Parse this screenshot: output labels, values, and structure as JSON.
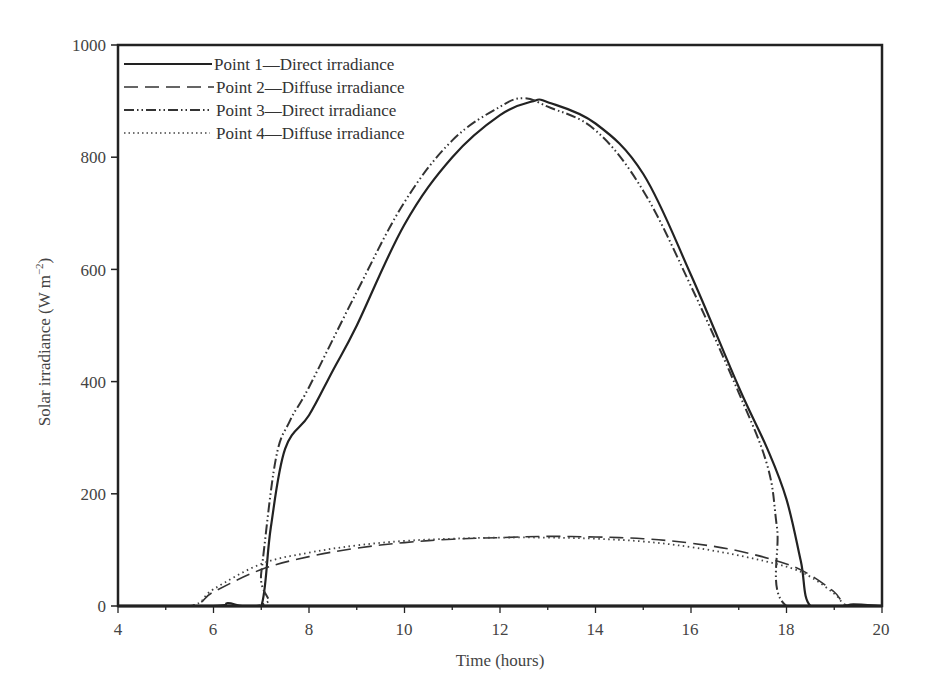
{
  "chart_data": {
    "type": "line",
    "title": "",
    "xlabel": "Time (hours)",
    "ylabel": "Solar irradiance (W m⁻²)",
    "xlim": [
      4,
      20
    ],
    "ylim": [
      0,
      1000
    ],
    "xticks": [
      4,
      6,
      8,
      10,
      12,
      14,
      16,
      18,
      20
    ],
    "yticks": [
      0,
      200,
      400,
      600,
      800,
      1000
    ],
    "grid": false,
    "legend_position": "upper-left",
    "series": [
      {
        "name": "Point 1—Direct irradiance",
        "style": "solid",
        "x": [
          4,
          6.0,
          6.3,
          6.6,
          7.0,
          7.2,
          7.5,
          8.0,
          8.5,
          9.0,
          10.0,
          11.0,
          12.0,
          12.7,
          13.0,
          14.0,
          15.0,
          16.0,
          17.0,
          17.6,
          18.0,
          18.3,
          18.5,
          19.2,
          19.4,
          20
        ],
        "y": [
          0,
          0,
          5,
          0,
          0,
          140,
          280,
          340,
          420,
          500,
          680,
          800,
          875,
          900,
          898,
          860,
          770,
          590,
          390,
          280,
          190,
          80,
          0,
          0,
          3,
          0
        ]
      },
      {
        "name": "Point 2—Diffuse irradiance",
        "style": "dashed",
        "x": [
          4,
          5.5,
          6.0,
          7.0,
          8.0,
          9.0,
          10.0,
          11.0,
          12.0,
          13.0,
          14.0,
          15.0,
          16.0,
          17.0,
          18.0,
          18.5,
          19.0,
          19.3,
          20
        ],
        "y": [
          0,
          0,
          25,
          65,
          88,
          103,
          113,
          119,
          122,
          124,
          123,
          120,
          112,
          98,
          75,
          55,
          25,
          0,
          0
        ]
      },
      {
        "name": "Point 3—Direct irradiance",
        "style": "dash-dot-dot",
        "x": [
          4,
          6.9,
          7.0,
          7.3,
          7.6,
          8.0,
          9.0,
          10.0,
          11.0,
          12.0,
          12.5,
          13.0,
          14.0,
          15.0,
          16.0,
          17.0,
          17.6,
          17.8,
          18.0,
          20
        ],
        "y": [
          0,
          0,
          60,
          260,
          330,
          390,
          560,
          720,
          830,
          890,
          905,
          890,
          848,
          740,
          570,
          380,
          250,
          140,
          0,
          0
        ]
      },
      {
        "name": "Point 4—Diffuse irradiance",
        "style": "dotted",
        "x": [
          4,
          5.5,
          6.0,
          7.0,
          8.0,
          9.0,
          10.0,
          11.0,
          12.0,
          13.0,
          14.0,
          15.0,
          16.0,
          17.0,
          18.0,
          18.5,
          19.0,
          19.3,
          20
        ],
        "y": [
          0,
          0,
          30,
          75,
          95,
          108,
          116,
          120,
          122,
          122,
          120,
          115,
          105,
          90,
          70,
          52,
          22,
          0,
          0
        ]
      }
    ]
  },
  "axes": {
    "xlabel": "Time (hours)",
    "ylabel_main": "Solar irradiance (W m",
    "ylabel_sup": "−2",
    "ylabel_close": ")",
    "xtick_labels": [
      "4",
      "6",
      "8",
      "10",
      "12",
      "14",
      "16",
      "18",
      "20"
    ],
    "ytick_labels": [
      "0",
      "200",
      "400",
      "600",
      "800",
      "1000"
    ]
  },
  "legend": {
    "items": [
      "Point 1—Direct irradiance",
      "Point 2—Diffuse irradiance",
      "Point 3—Direct irradiance",
      "Point 4—Diffuse irradiance"
    ]
  }
}
